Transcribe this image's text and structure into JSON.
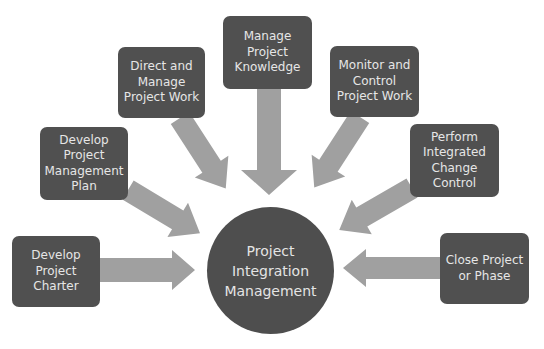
{
  "diagram": {
    "type": "hub-and-spoke",
    "colors": {
      "box_fill": "#505050",
      "hub_fill": "#4e4e4e",
      "arrow_fill": "#a0a0a0",
      "text": "#e6e6e6",
      "background": "#ffffff"
    },
    "hub": {
      "label": "Project\nIntegration\nManagement"
    },
    "processes": [
      {
        "id": "develop-project-charter",
        "label": "Develop\nProject\nCharter"
      },
      {
        "id": "develop-pm-plan",
        "label": "Develop\nProject\nManagement\nPlan"
      },
      {
        "id": "direct-manage-work",
        "label": "Direct and\nManage\nProject Work"
      },
      {
        "id": "manage-knowledge",
        "label": "Manage\nProject\nKnowledge"
      },
      {
        "id": "monitor-control-work",
        "label": "Monitor and\nControl\nProject Work"
      },
      {
        "id": "perform-change-control",
        "label": "Perform\nIntegrated\nChange\nControl"
      },
      {
        "id": "close-project-phase",
        "label": "Close Project\nor Phase"
      }
    ],
    "edges": [
      {
        "from": "develop-project-charter",
        "to": "hub"
      },
      {
        "from": "develop-pm-plan",
        "to": "hub"
      },
      {
        "from": "direct-manage-work",
        "to": "hub"
      },
      {
        "from": "manage-knowledge",
        "to": "hub"
      },
      {
        "from": "monitor-control-work",
        "to": "hub"
      },
      {
        "from": "perform-change-control",
        "to": "hub"
      },
      {
        "from": "close-project-phase",
        "to": "hub"
      }
    ]
  }
}
